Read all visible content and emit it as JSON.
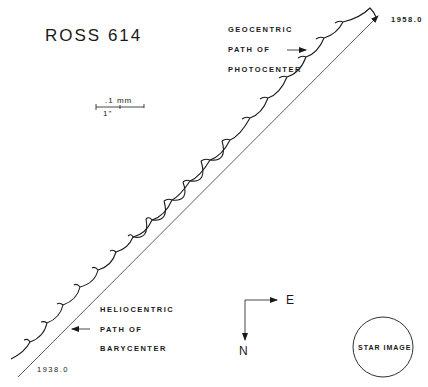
{
  "title": "ROSS 614",
  "scale_bar": {
    "top_label": ".1  mm",
    "bottom_label": "1\""
  },
  "annotations": {
    "geocentric": [
      "GEOCENTRIC",
      "PATH OF",
      "PHOTOCENTER"
    ],
    "heliocentric": [
      "HELIOCENTRIC",
      "PATH OF",
      "BARYCENTER"
    ]
  },
  "epochs": {
    "end": "1958.0",
    "start": "1938.0"
  },
  "compass": {
    "east": "E",
    "north": "N"
  },
  "star_image_label": "STAR IMAGE",
  "colors": {
    "ink": "#1a1a1a",
    "background": "#ffffff"
  }
}
